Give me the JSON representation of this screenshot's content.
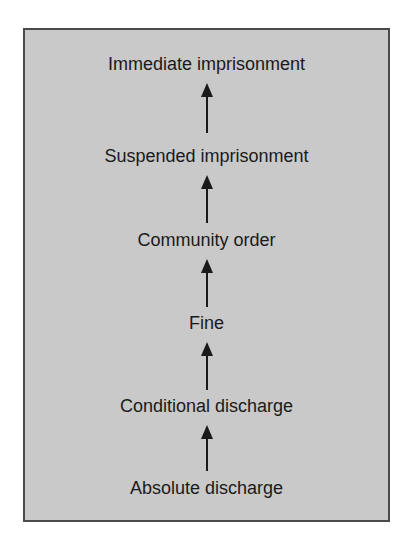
{
  "diagram": {
    "title": "",
    "direction": "bottom-to-top",
    "colors": {
      "background": "#c9c9c9",
      "border": "#4a4a4a",
      "text": "#1a1a1a"
    },
    "levels": [
      {
        "label": "Immediate imprisonment"
      },
      {
        "label": "Suspended imprisonment"
      },
      {
        "label": "Community order"
      },
      {
        "label": "Fine"
      },
      {
        "label": "Conditional discharge"
      },
      {
        "label": "Absolute discharge"
      }
    ],
    "edges": [
      {
        "from": "Absolute discharge",
        "to": "Conditional discharge",
        "icon": "arrow-up-icon"
      },
      {
        "from": "Conditional discharge",
        "to": "Fine",
        "icon": "arrow-up-icon"
      },
      {
        "from": "Fine",
        "to": "Community order",
        "icon": "arrow-up-icon"
      },
      {
        "from": "Community order",
        "to": "Suspended imprisonment",
        "icon": "arrow-up-icon"
      },
      {
        "from": "Suspended imprisonment",
        "to": "Immediate imprisonment",
        "icon": "arrow-up-icon"
      }
    ]
  }
}
